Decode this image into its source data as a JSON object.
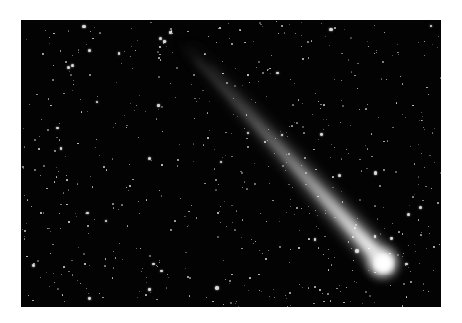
{
  "image": {
    "subject": "Comet with long tail against a star field",
    "caption": "Comet streaking across a starry night sky",
    "colors": {
      "background": "#ffffff",
      "sky": "#030303",
      "comet_head": "#ffffff",
      "tail": "#bfbfbf"
    },
    "comet": {
      "head_x": 362,
      "head_y": 243,
      "tail_end_x": 150,
      "tail_end_y": 20
    }
  }
}
